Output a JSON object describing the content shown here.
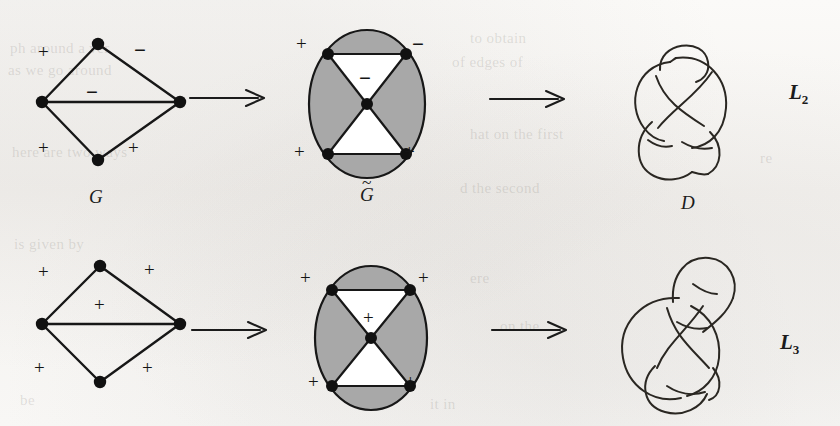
{
  "figure": {
    "caption_labels": {
      "graph_top": "G",
      "medial_top_base": "G",
      "medial_top_accent": "~",
      "diagram_top": "D",
      "link_top": "L",
      "link_top_sub": "2",
      "link_bottom": "L",
      "link_bottom_sub": "3"
    },
    "colors": {
      "page_background": "#f7f6f4",
      "ink": "#1b1b1b",
      "shaded_region": "#a8a8a8",
      "unshaded_region": "#ffffff",
      "vertex": "#111111"
    }
  },
  "rows": [
    {
      "id": "row-top",
      "graph": {
        "name": "signed-graph-G",
        "label": "G",
        "edge_signs": {
          "upper_left": "+",
          "upper_right": "−",
          "middle": "−",
          "lower_left": "+",
          "lower_right": "+"
        },
        "vertices": 4,
        "edges": 5
      },
      "medial": {
        "name": "medial-graph-G-tilde",
        "label": "G̃",
        "region_signs": {
          "upper_left": "+",
          "upper_right": "−",
          "middle": "−",
          "lower_left": "+",
          "lower_right": "+"
        },
        "vertices": 5,
        "shaded_regions": [
          "top-cap",
          "left-wedge",
          "right-wedge",
          "bottom-cap"
        ],
        "unshaded_regions": [
          "upper-triangle",
          "lower-triangle"
        ]
      },
      "diagram": {
        "name": "link-diagram-D",
        "label": "D",
        "crossings": 5
      },
      "link": {
        "name": "link-L2",
        "base": "L",
        "subscript": "2"
      },
      "arrows": 2
    },
    {
      "id": "row-bottom",
      "graph": {
        "name": "signed-graph-all-plus",
        "label": "",
        "edge_signs": {
          "upper_left": "+",
          "upper_right": "+",
          "middle": "+",
          "lower_left": "+",
          "lower_right": "+"
        },
        "vertices": 4,
        "edges": 5
      },
      "medial": {
        "name": "medial-graph-all-plus",
        "label": "",
        "region_signs": {
          "upper_left": "+",
          "upper_right": "+",
          "middle": "+",
          "lower_left": "+",
          "lower_right": "+"
        },
        "vertices": 5,
        "shaded_regions": [
          "top-cap",
          "left-wedge",
          "right-wedge",
          "bottom-cap"
        ],
        "unshaded_regions": [
          "upper-triangle",
          "lower-triangle"
        ]
      },
      "diagram": {
        "name": "link-diagram-bottom",
        "label": "",
        "crossings": 5
      },
      "link": {
        "name": "link-L3",
        "base": "L",
        "subscript": "3"
      },
      "arrows": 2
    }
  ],
  "background_text": [
    "to obtain",
    "of edges of",
    "ph around a ver",
    "as we go around",
    "here are two ways",
    "hat on the first",
    "re",
    "d the second",
    "is given by",
    "ere",
    "on the",
    "be",
    "it in"
  ]
}
